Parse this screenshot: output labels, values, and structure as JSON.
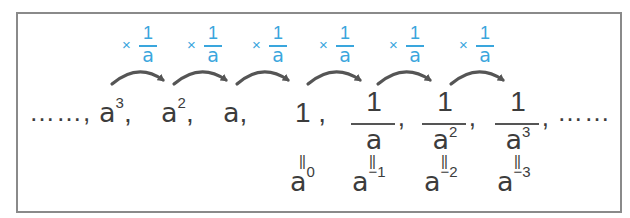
{
  "diagram": {
    "multiplier": {
      "symbol": "×",
      "numerator": "1",
      "denominator": "a"
    },
    "leading_ellipsis": "……,",
    "trailing_ellipsis": "……",
    "terms": [
      {
        "base": "a",
        "exp": "3",
        "suffix": ","
      },
      {
        "base": "a",
        "exp": "2",
        "suffix": ","
      },
      {
        "base": "a",
        "exp": "",
        "suffix": ","
      },
      {
        "base": "1",
        "exp": "",
        "suffix": " ,"
      }
    ],
    "fractions": [
      {
        "numerator": "1",
        "den_base": "a",
        "den_exp": "",
        "suffix": ","
      },
      {
        "numerator": "1",
        "den_base": "a",
        "den_exp": "2",
        "suffix": ","
      },
      {
        "numerator": "1",
        "den_base": "a",
        "den_exp": "3",
        "suffix": ","
      }
    ],
    "equals_symbol": "||",
    "powers": [
      {
        "base": "a",
        "exp": "0"
      },
      {
        "base": "a",
        "exp": "−1"
      },
      {
        "base": "a",
        "exp": "−2"
      },
      {
        "base": "a",
        "exp": "−3"
      }
    ],
    "colors": {
      "accent": "#3aa6dd",
      "arrow": "#555555",
      "text": "#3c3c3c",
      "border": "#8a8a8a"
    }
  }
}
